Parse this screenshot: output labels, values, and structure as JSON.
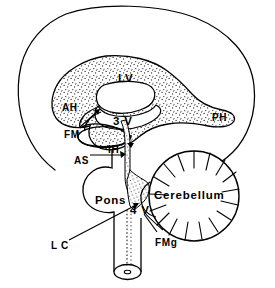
{
  "figure": {
    "type": "anatomical-line-diagram",
    "background_color": "#ffffff",
    "ink_color": "#000000",
    "stipple_color": "#1a1a1a",
    "width": 275,
    "height": 288
  },
  "labels": [
    {
      "id": "LV",
      "text": "LV",
      "meaning": "lateral ventricle",
      "x": 118,
      "y": 73,
      "size": "lg"
    },
    {
      "id": "AH",
      "text": "AH",
      "meaning": "anterior horn",
      "x": 62,
      "y": 103,
      "size": "md"
    },
    {
      "id": "PH",
      "text": "PH",
      "meaning": "posterior horn",
      "x": 212,
      "y": 113,
      "size": "md"
    },
    {
      "id": "3V",
      "text": "3 V",
      "meaning": "third ventricle",
      "x": 113,
      "y": 116,
      "size": "lg"
    },
    {
      "id": "FM",
      "text": "FM",
      "meaning": "foramen of Monro",
      "x": 64,
      "y": 130,
      "size": "md"
    },
    {
      "id": "IH",
      "text": "IH",
      "meaning": "inferior horn",
      "x": 108,
      "y": 145,
      "size": "md"
    },
    {
      "id": "AS",
      "text": "AS",
      "meaning": "aqueduct of Sylvius",
      "x": 74,
      "y": 156,
      "size": "md"
    },
    {
      "id": "Pons",
      "text": "Pons",
      "meaning": "pons",
      "x": 95,
      "y": 195,
      "size": "lg"
    },
    {
      "id": "Cerebellum",
      "text": "Cerebellum",
      "meaning": "cerebellum",
      "x": 154,
      "y": 190,
      "size": "lg"
    },
    {
      "id": "4V",
      "text": "4 V",
      "meaning": "fourth ventricle",
      "x": 130,
      "y": 205,
      "size": "lg"
    },
    {
      "id": "LC",
      "text": "L C",
      "meaning": "lateral canal",
      "x": 51,
      "y": 241,
      "size": "md"
    },
    {
      "id": "FMg",
      "text": "FMg",
      "meaning": "foramen of Magendie",
      "x": 155,
      "y": 238,
      "size": "md"
    }
  ],
  "structures": [
    {
      "name": "cerebral-outline",
      "style": "outline"
    },
    {
      "name": "lateral-ventricle",
      "style": "stippled"
    },
    {
      "name": "third-ventricle",
      "style": "outline"
    },
    {
      "name": "inferior-horn",
      "style": "outline"
    },
    {
      "name": "foramen-of-monro",
      "style": "outline"
    },
    {
      "name": "cerebral-aqueduct",
      "style": "stippled-channel"
    },
    {
      "name": "pons",
      "style": "outline"
    },
    {
      "name": "cerebellum",
      "style": "outline-foliated"
    },
    {
      "name": "fourth-ventricle",
      "style": "stippled"
    },
    {
      "name": "spinal-cord",
      "style": "outline-cylinder"
    },
    {
      "name": "central-canal",
      "style": "outline"
    }
  ],
  "caption": {
    "text": ""
  }
}
